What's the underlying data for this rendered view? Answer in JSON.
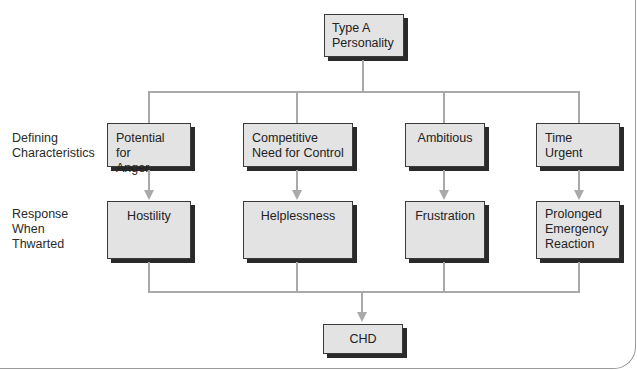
{
  "diagram": {
    "root": {
      "label": "Type A\nPersonality"
    },
    "row_labels": {
      "defining": "Defining\nCharacteristics",
      "response": "Response\nWhen\nThwarted"
    },
    "characteristics": [
      {
        "label": "Potential for\nAnger"
      },
      {
        "label": "Competitive\nNeed for Control"
      },
      {
        "label": "Ambitious"
      },
      {
        "label": "Time\nUrgent"
      }
    ],
    "responses": [
      {
        "label": "Hostility"
      },
      {
        "label": "Helplessness"
      },
      {
        "label": "Frustration"
      },
      {
        "label": "Prolonged\nEmergency\nReaction"
      }
    ],
    "outcome": {
      "label": "CHD"
    },
    "colors": {
      "box_fill": "#e3e3e3",
      "box_border": "#3a3a3a",
      "shadow": "#2a2a2a",
      "connector": "#a9a9a9"
    }
  }
}
